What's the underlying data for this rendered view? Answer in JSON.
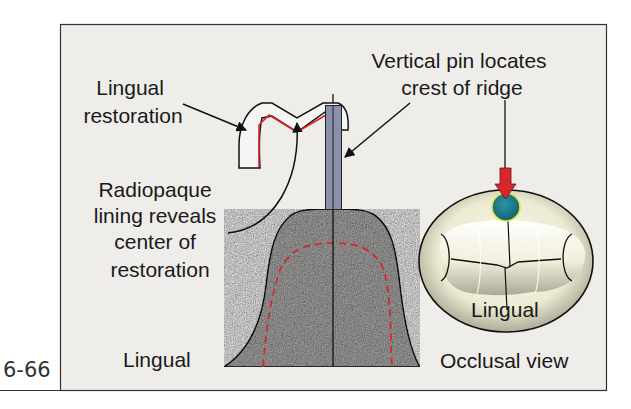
{
  "figure": {
    "number": "6-66",
    "colors": {
      "panel_bg": "#efedea",
      "panel_border": "#333333",
      "ridge_fill": "#b4b2b0",
      "pin_fill": "#8a90ac",
      "lining_red": "#d8262a",
      "arrow_red": "#d8262a",
      "dot_blue": "#1f7f90",
      "dot_glow": "#d9e84a",
      "tooth_light": "#f6f4e2",
      "tooth_shadow": "#8a8878"
    },
    "labels": {
      "lingual_restoration": [
        "Lingual",
        "restoration"
      ],
      "vertical_pin": [
        "Vertical pin locates",
        "crest of ridge"
      ],
      "radiopaque_lining": [
        "Radiopaque",
        "lining reveals",
        "center of",
        "restoration"
      ],
      "lingual_bottom": "Lingual",
      "occlusal_view": "Occlusal view",
      "lingual_in_occlusal": "Lingual"
    }
  }
}
